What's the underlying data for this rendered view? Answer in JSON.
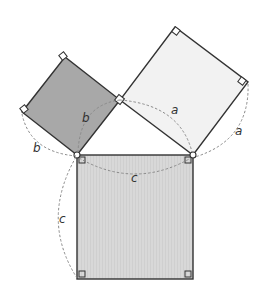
{
  "diagram": {
    "labels": {
      "a_inner": "a",
      "a_outer": "a",
      "b_inner": "b",
      "b_outer": "b",
      "c_inner": "c",
      "c_outer": "c"
    },
    "colors": {
      "square_b": "#a9a9a9",
      "square_a": "#f0f0f0",
      "square_c": "#d6d6d6",
      "stroke": "#333333",
      "arc": "#888888"
    }
  }
}
